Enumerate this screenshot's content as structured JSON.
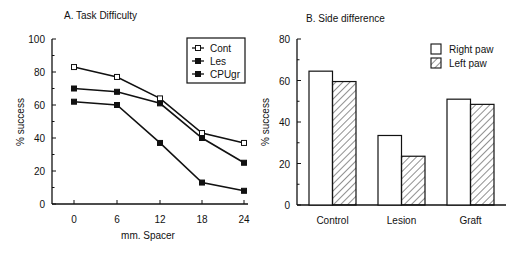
{
  "chart_data": [
    {
      "type": "line",
      "title": "A. Task Difficulty",
      "xlabel": "mm. Spacer",
      "ylabel": "% success",
      "x": [
        0,
        6,
        12,
        18,
        24
      ],
      "x_ticks": [
        "0",
        "6",
        "12",
        "18",
        "24"
      ],
      "y_ticks": [
        "0",
        "20",
        "40",
        "60",
        "80",
        "100"
      ],
      "ylim": [
        0,
        100
      ],
      "grid": false,
      "legend_position": "top-right (boxed)",
      "series": [
        {
          "name": "Cont",
          "marker": "open-square",
          "values": [
            83,
            77,
            64,
            43,
            37
          ]
        },
        {
          "name": "Les",
          "marker": "filled-square",
          "values": [
            70,
            68,
            61,
            40,
            25
          ]
        },
        {
          "name": "CPUgr",
          "marker": "filled-square",
          "values": [
            62,
            60,
            37,
            13,
            8
          ]
        }
      ]
    },
    {
      "type": "bar",
      "title": "B. Side difference",
      "xlabel": "",
      "ylabel": "% success",
      "categories": [
        "Control",
        "Lesion",
        "Graft"
      ],
      "y_ticks": [
        "0",
        "20",
        "40",
        "60",
        "80"
      ],
      "ylim": [
        0,
        80
      ],
      "grid": false,
      "legend_position": "top-right",
      "series": [
        {
          "name": "Right paw",
          "fill": "white",
          "values": [
            64.5,
            33.5,
            51
          ]
        },
        {
          "name": "Left paw",
          "fill": "hatched",
          "values": [
            59.5,
            23.5,
            48.5
          ]
        }
      ]
    }
  ]
}
